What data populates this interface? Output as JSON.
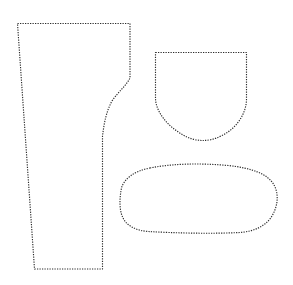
{
  "document": {
    "title": "Sewing Pattern Pieces",
    "background_color": "#ffffff",
    "width": 293,
    "height": 285
  },
  "style": {
    "outline_color": "#2b2b2b",
    "fill_color": "#ffffff",
    "stroke_width": 1.15,
    "dash_pattern": "1.25 1.25",
    "line_style": "dotted"
  },
  "pieces": [
    {
      "id": "leg-panel",
      "name": "Tapered Leg Panel",
      "description": "Tall four-sided panel, wide flat top, narrow flat bottom, straight slanted left edge and right edge with an inward curve near the upper third.",
      "bounds": {
        "x": 17,
        "y": 23,
        "width": 113,
        "height": 246
      },
      "path": "M 17.5,23.5 L 130,23.5 L 130,78 C 126,86 118,92 112,101 C 106,112 104,124 102.5,136 L 102.5,269 L 34.5,269 L 17.5,23.5 Z"
    },
    {
      "id": "pocket-shield",
      "name": "Shield Pocket Piece",
      "description": "Rectangular top with straight sides that curve inward and meet at a rounded point at the bottom centre.",
      "bounds": {
        "x": 155,
        "y": 52,
        "width": 92,
        "height": 89
      },
      "path": "M 155.5,52.5 L 246.5,52.5 L 246.5,99 C 246.5,114 236,129 221,136 C 214,139.5 208,140.5 203,140.5 C 197,140.5 190,139 183,135 C 168,126.5 155.5,112 155.5,98 Z"
    },
    {
      "id": "oval-panel",
      "name": "Rounded Oval Panel",
      "description": "Horizontally elongated rounded shape, flatter along the bottom edge, fuller and taller on the right side.",
      "bounds": {
        "x": 120,
        "y": 163,
        "width": 157,
        "height": 71
      },
      "path": "M 150,168 C 173,163.5 200,163 228,165.5 C 252,168 268,174 274,185 C 279,194 278,206 272,216 C 266,226 254,231.5 240,232.5 C 210,234 175,233 148,231.5 C 136,230.5 127,226 123,218 C 119,210 119.5,198 121.5,188 C 124,179 134,171 150,168 Z"
    }
  ]
}
